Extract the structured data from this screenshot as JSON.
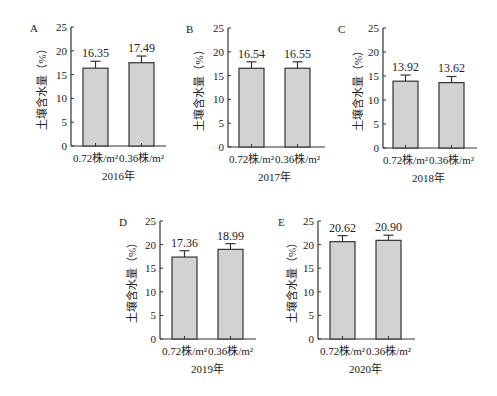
{
  "figure": {
    "y_axis_label": "土壤含水量（%）",
    "bar_fill": "#d2d2d2",
    "bar_stroke": "#333333",
    "axis_color": "#333333"
  },
  "chart_data": [
    {
      "panel": "A",
      "type": "bar",
      "title": "",
      "xlabel": "2016年",
      "ylabel": "土壤含水量（%）",
      "categories": [
        "0.72株/m²",
        "0.36株/m²"
      ],
      "values": [
        16.35,
        17.49
      ],
      "value_labels": [
        "16.35",
        "17.49"
      ],
      "error_upper": [
        17.8,
        18.9
      ],
      "ylim": [
        0,
        25
      ],
      "yticks": [
        0,
        5,
        10,
        15,
        20,
        25
      ],
      "grid": false,
      "legend": null
    },
    {
      "panel": "B",
      "type": "bar",
      "title": "",
      "xlabel": "2017年",
      "ylabel": "土壤含水量（%）",
      "categories": [
        "0.72株/m²",
        "0.36株/m²"
      ],
      "values": [
        16.54,
        16.55
      ],
      "value_labels": [
        "16.54",
        "16.55"
      ],
      "error_upper": [
        17.9,
        17.9
      ],
      "ylim": [
        0,
        25
      ],
      "yticks": [
        0,
        5,
        10,
        15,
        20,
        25
      ],
      "grid": false,
      "legend": null
    },
    {
      "panel": "C",
      "type": "bar",
      "title": "",
      "xlabel": "2018年",
      "ylabel": "土壤含水量（%）",
      "categories": [
        "0.72株/m²",
        "0.36株/m²"
      ],
      "values": [
        13.92,
        13.62
      ],
      "value_labels": [
        "13.92",
        "13.62"
      ],
      "error_upper": [
        15.2,
        14.9
      ],
      "ylim": [
        0,
        25
      ],
      "yticks": [
        0,
        5,
        10,
        15,
        20,
        25
      ],
      "grid": false,
      "legend": null
    },
    {
      "panel": "D",
      "type": "bar",
      "title": "",
      "xlabel": "2019年",
      "ylabel": "土壤含水量（%）",
      "categories": [
        "0.72株/m²",
        "0.36株/m²"
      ],
      "values": [
        17.36,
        18.99
      ],
      "value_labels": [
        "17.36",
        "18.99"
      ],
      "error_upper": [
        18.7,
        20.2
      ],
      "ylim": [
        0,
        25
      ],
      "yticks": [
        0,
        5,
        10,
        15,
        20,
        25
      ],
      "grid": false,
      "legend": null
    },
    {
      "panel": "E",
      "type": "bar",
      "title": "",
      "xlabel": "2020年",
      "ylabel": "土壤含水量（%）",
      "categories": [
        "0.72株/m²",
        "0.36株/m²"
      ],
      "values": [
        20.62,
        20.9
      ],
      "value_labels": [
        "20.62",
        "20.90"
      ],
      "error_upper": [
        21.9,
        22.0
      ],
      "ylim": [
        0,
        25
      ],
      "yticks": [
        0,
        5,
        10,
        15,
        20,
        25
      ],
      "grid": false,
      "legend": null
    }
  ],
  "layout": [
    {
      "axis_x": 71,
      "top_y": 27,
      "base_y": 146,
      "bar_x": [
        83,
        129
      ],
      "bar_w": 25,
      "axis_end": 166,
      "letter_x": 30,
      "ylabel_x": 18
    },
    {
      "axis_x": 228,
      "top_y": 28,
      "base_y": 147,
      "bar_x": [
        239,
        285
      ],
      "bar_w": 25,
      "axis_end": 325,
      "letter_x": 186,
      "ylabel_x": 175
    },
    {
      "axis_x": 383,
      "top_y": 28,
      "base_y": 148,
      "bar_x": [
        393,
        439
      ],
      "bar_w": 25,
      "axis_end": 477,
      "letter_x": 338,
      "ylabel_x": 334
    },
    {
      "axis_x": 160,
      "top_y": 221,
      "base_y": 339,
      "bar_x": [
        172,
        218
      ],
      "bar_w": 25,
      "axis_end": 256,
      "letter_x": 119,
      "ylabel_x": 108
    },
    {
      "axis_x": 318,
      "top_y": 221,
      "base_y": 339,
      "bar_x": [
        330,
        376
      ],
      "bar_w": 25,
      "axis_end": 415,
      "letter_x": 278,
      "ylabel_x": 268
    }
  ]
}
